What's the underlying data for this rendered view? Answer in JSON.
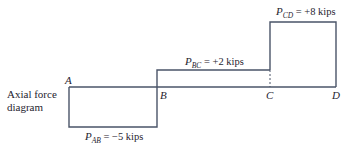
{
  "diagram": {
    "title_line1": "Axial force",
    "title_line2": "diagram",
    "points": [
      {
        "label": "A"
      },
      {
        "label": "B"
      },
      {
        "label": "C"
      },
      {
        "label": "D"
      }
    ],
    "segments": [
      {
        "name": "AB",
        "symbol": "P",
        "subscript": "AB",
        "value_text": " = −5 kips",
        "value": -5,
        "unit": "kips"
      },
      {
        "name": "BC",
        "symbol": "P",
        "subscript": "BC",
        "value_text": " = +2 kips",
        "value": 2,
        "unit": "kips"
      },
      {
        "name": "CD",
        "symbol": "P",
        "subscript": "CD",
        "value_text": " = +8 kips",
        "value": 8,
        "unit": "kips"
      }
    ],
    "colors": {
      "line": "#4a5468",
      "text": "#1f2430"
    }
  }
}
